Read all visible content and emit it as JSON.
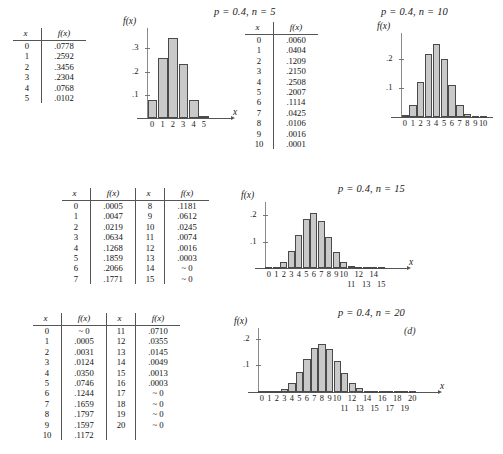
{
  "figure": {
    "panel_letter": "(d)",
    "bar_fill": "#c9c9c9",
    "bar_stroke": "#4a4a4a",
    "axis_color": "#555555"
  },
  "charts": [
    {
      "id": "n5",
      "title": "p = 0.4,  n = 5",
      "type": "bar",
      "xlabel": "x",
      "ylabel": "f(x)",
      "categories": [
        "0",
        "1",
        "2",
        "3",
        "4",
        "5"
      ],
      "values": [
        0.0778,
        0.2592,
        0.3456,
        0.2304,
        0.0768,
        0.0102
      ],
      "yticks": [
        ".1",
        ".2",
        ".3"
      ],
      "ytickvals": [
        0.1,
        0.2,
        0.3
      ],
      "ylim": [
        0,
        0.37
      ],
      "xticks_top": [
        "0",
        "1",
        "2",
        "3",
        "4",
        "5"
      ],
      "xticks_bottom": []
    },
    {
      "id": "n10",
      "title": "p = 0.4,  n = 10",
      "type": "bar",
      "xlabel": "",
      "ylabel": "f(x)",
      "categories": [
        "0",
        "1",
        "2",
        "3",
        "4",
        "5",
        "6",
        "7",
        "8",
        "9",
        "10"
      ],
      "values": [
        0.006,
        0.0404,
        0.1209,
        0.215,
        0.2508,
        0.2007,
        0.1114,
        0.0425,
        0.0106,
        0.0016,
        0.0001
      ],
      "yticks": [
        ".1",
        ".2"
      ],
      "ytickvals": [
        0.1,
        0.2
      ],
      "ylim": [
        0,
        0.275
      ],
      "xticks_top": [
        "0",
        "1",
        "2",
        "3",
        "4",
        "5",
        "6",
        "7",
        "8",
        "9",
        "10"
      ],
      "xticks_bottom": []
    },
    {
      "id": "n15",
      "title": "p = 0.4,  n = 15",
      "type": "bar",
      "xlabel": "x",
      "ylabel": "f(x)",
      "categories": [
        "0",
        "1",
        "2",
        "3",
        "4",
        "5",
        "6",
        "7",
        "8",
        "9",
        "10",
        "11",
        "12",
        "13",
        "14",
        "15"
      ],
      "values": [
        0.0005,
        0.0047,
        0.0219,
        0.0634,
        0.1268,
        0.1859,
        0.2066,
        0.1771,
        0.1181,
        0.0612,
        0.0245,
        0.0074,
        0.0016,
        0.0003,
        0.0,
        0.0
      ],
      "yticks": [
        ".1",
        ".2"
      ],
      "ytickvals": [
        0.1,
        0.2
      ],
      "ylim": [
        0,
        0.235
      ],
      "xticks_top": [
        "0",
        "1",
        "2",
        "3",
        "4",
        "5",
        "6",
        "7",
        "8",
        "9",
        "10",
        "",
        "12",
        "",
        "14",
        ""
      ],
      "xticks_bottom": [
        "",
        "",
        "",
        "",
        "",
        "",
        "",
        "",
        "",
        "",
        "",
        "11",
        "",
        "13",
        "",
        "15"
      ]
    },
    {
      "id": "n20",
      "title": "p = 0.4,  n = 20",
      "type": "bar",
      "xlabel": "x",
      "ylabel": "f(x)",
      "categories": [
        "0",
        "1",
        "2",
        "3",
        "4",
        "5",
        "6",
        "7",
        "8",
        "9",
        "10",
        "11",
        "12",
        "13",
        "14",
        "15",
        "16",
        "17",
        "18",
        "19",
        "20"
      ],
      "values": [
        0.0,
        0.0005,
        0.0031,
        0.0124,
        0.035,
        0.0746,
        0.1244,
        0.1659,
        0.1797,
        0.1597,
        0.1172,
        0.071,
        0.0355,
        0.0145,
        0.0049,
        0.0013,
        0.0003,
        0.0,
        0.0,
        0.0,
        0.0
      ],
      "yticks": [
        ".1",
        ".2"
      ],
      "ytickvals": [
        0.1,
        0.2
      ],
      "ylim": [
        0,
        0.225
      ],
      "xticks_top": [
        "0",
        "1",
        "2",
        "3",
        "4",
        "5",
        "6",
        "7",
        "8",
        "9",
        "10",
        "",
        "12",
        "",
        "14",
        "",
        "16",
        "",
        "18",
        "",
        "20"
      ],
      "xticks_bottom": [
        "",
        "",
        "",
        "",
        "",
        "",
        "",
        "",
        "",
        "",
        "",
        "11",
        "",
        "13",
        "",
        "15",
        "",
        "17",
        "",
        "19",
        ""
      ]
    }
  ],
  "tables": [
    {
      "id": "table-n5",
      "blocks": [
        {
          "headers": [
            "x",
            "f(x)"
          ],
          "rows": [
            [
              "0",
              ".0778"
            ],
            [
              "1",
              ".2592"
            ],
            [
              "2",
              ".3456"
            ],
            [
              "3",
              ".2304"
            ],
            [
              "4",
              ".0768"
            ],
            [
              "5",
              ".0102"
            ]
          ]
        }
      ]
    },
    {
      "id": "table-n10",
      "blocks": [
        {
          "headers": [
            "x",
            "f(x)"
          ],
          "rows": [
            [
              "0",
              ".0060"
            ],
            [
              "1",
              ".0404"
            ],
            [
              "2",
              ".1209"
            ],
            [
              "3",
              ".2150"
            ],
            [
              "4",
              ".2508"
            ],
            [
              "5",
              ".2007"
            ],
            [
              "6",
              ".1114"
            ],
            [
              "7",
              ".0425"
            ],
            [
              "8",
              ".0106"
            ],
            [
              "9",
              ".0016"
            ],
            [
              "10",
              ".0001"
            ]
          ]
        }
      ]
    },
    {
      "id": "table-n15",
      "blocks": [
        {
          "headers": [
            "x",
            "f(x)"
          ],
          "rows": [
            [
              "0",
              ".0005"
            ],
            [
              "1",
              ".0047"
            ],
            [
              "2",
              ".0219"
            ],
            [
              "3",
              ".0634"
            ],
            [
              "4",
              ".1268"
            ],
            [
              "5",
              ".1859"
            ],
            [
              "6",
              ".2066"
            ],
            [
              "7",
              ".1771"
            ]
          ]
        },
        {
          "headers": [
            "x",
            "f(x)"
          ],
          "rows": [
            [
              "8",
              ".1181"
            ],
            [
              "9",
              ".0612"
            ],
            [
              "10",
              ".0245"
            ],
            [
              "11",
              ".0074"
            ],
            [
              "12",
              ".0016"
            ],
            [
              "13",
              ".0003"
            ],
            [
              "14",
              "~ 0"
            ],
            [
              "15",
              "~ 0"
            ]
          ]
        }
      ]
    },
    {
      "id": "table-n20",
      "blocks": [
        {
          "headers": [
            "x",
            "f(x)"
          ],
          "rows": [
            [
              "0",
              "~ 0"
            ],
            [
              "1",
              ".0005"
            ],
            [
              "2",
              ".0031"
            ],
            [
              "3",
              ".0124"
            ],
            [
              "4",
              ".0350"
            ],
            [
              "5",
              ".0746"
            ],
            [
              "6",
              ".1244"
            ],
            [
              "7",
              ".1659"
            ],
            [
              "8",
              ".1797"
            ],
            [
              "9",
              ".1597"
            ],
            [
              "10",
              ".1172"
            ]
          ]
        },
        {
          "headers": [
            "x",
            "f(x)"
          ],
          "rows": [
            [
              "11",
              ".0710"
            ],
            [
              "12",
              ".0355"
            ],
            [
              "13",
              ".0145"
            ],
            [
              "14",
              ".0049"
            ],
            [
              "15",
              ".0013"
            ],
            [
              "16",
              ".0003"
            ],
            [
              "17",
              "~ 0"
            ],
            [
              "18",
              "~ 0"
            ],
            [
              "19",
              "~ 0"
            ],
            [
              "20",
              "~ 0"
            ]
          ]
        }
      ]
    }
  ],
  "chart_data": {
    "type": "bar",
    "xlabel": "x",
    "ylabel": "f(x)",
    "panels": [
      {
        "name": "p = 0.4, n = 5",
        "categories": [
          0,
          1,
          2,
          3,
          4,
          5
        ],
        "values": [
          0.0778,
          0.2592,
          0.3456,
          0.2304,
          0.0768,
          0.0102
        ],
        "ylim": [
          0,
          0.37
        ],
        "yticks": [
          0.1,
          0.2,
          0.3
        ],
        "grid": false
      },
      {
        "name": "p = 0.4, n = 10",
        "categories": [
          0,
          1,
          2,
          3,
          4,
          5,
          6,
          7,
          8,
          9,
          10
        ],
        "values": [
          0.006,
          0.0404,
          0.1209,
          0.215,
          0.2508,
          0.2007,
          0.1114,
          0.0425,
          0.0106,
          0.0016,
          0.0001
        ],
        "ylim": [
          0,
          0.275
        ],
        "yticks": [
          0.1,
          0.2
        ],
        "grid": false
      },
      {
        "name": "p = 0.4, n = 15",
        "categories": [
          0,
          1,
          2,
          3,
          4,
          5,
          6,
          7,
          8,
          9,
          10,
          11,
          12,
          13,
          14,
          15
        ],
        "values": [
          0.0005,
          0.0047,
          0.0219,
          0.0634,
          0.1268,
          0.1859,
          0.2066,
          0.1771,
          0.1181,
          0.0612,
          0.0245,
          0.0074,
          0.0016,
          0.0003,
          0.0,
          0.0
        ],
        "ylim": [
          0,
          0.235
        ],
        "yticks": [
          0.1,
          0.2
        ],
        "grid": false
      },
      {
        "name": "p = 0.4, n = 20",
        "categories": [
          0,
          1,
          2,
          3,
          4,
          5,
          6,
          7,
          8,
          9,
          10,
          11,
          12,
          13,
          14,
          15,
          16,
          17,
          18,
          19,
          20
        ],
        "values": [
          0.0,
          0.0005,
          0.0031,
          0.0124,
          0.035,
          0.0746,
          0.1244,
          0.1659,
          0.1797,
          0.1597,
          0.1172,
          0.071,
          0.0355,
          0.0145,
          0.0049,
          0.0013,
          0.0003,
          0.0,
          0.0,
          0.0,
          0.0
        ],
        "ylim": [
          0,
          0.225
        ],
        "yticks": [
          0.1,
          0.2
        ],
        "grid": false
      }
    ],
    "legend": null,
    "legend_position": "none"
  }
}
